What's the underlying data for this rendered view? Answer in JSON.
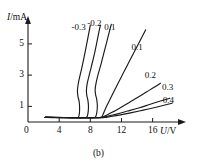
{
  "figure": {
    "caption": "(b)",
    "axes": {
      "y_axis_title": "I/mA",
      "y_axis_symbol": "I",
      "y_axis_unit": "/mA",
      "x_axis_title": "U/V",
      "x_axis_symbol": "U",
      "x_axis_unit": "/V",
      "origin_label": "0"
    }
  },
  "chart_data": {
    "type": "line",
    "title": "(b)",
    "xlabel": "U/V",
    "ylabel": "I/mA",
    "xlim": [
      0,
      19
    ],
    "ylim": [
      0,
      6.4
    ],
    "xticks": [
      0,
      4,
      8,
      12,
      16
    ],
    "xtick_labels": [
      "0",
      "4",
      "8",
      "12",
      "16"
    ],
    "yticks": [
      1,
      3,
      5
    ],
    "ytick_labels": [
      "1",
      "3",
      "5"
    ],
    "grid": false,
    "legend": "inline-curve-labels",
    "series": [
      {
        "name": "-0.3",
        "label": "-0.3",
        "label_position": {
          "x": 5.6,
          "y": 6.05
        },
        "points": [
          [
            2.2,
            0.3
          ],
          [
            3.5,
            0.28
          ],
          [
            5.0,
            0.27
          ],
          [
            6.0,
            0.27
          ],
          [
            6.45,
            0.3
          ],
          [
            6.6,
            0.55
          ],
          [
            6.62,
            1.0
          ],
          [
            6.55,
            1.35
          ],
          [
            6.42,
            1.62
          ],
          [
            6.35,
            1.95
          ],
          [
            6.42,
            2.35
          ],
          [
            6.62,
            2.85
          ],
          [
            6.9,
            3.45
          ],
          [
            7.2,
            4.15
          ],
          [
            7.5,
            4.9
          ],
          [
            7.78,
            5.62
          ],
          [
            8.0,
            6.2
          ]
        ]
      },
      {
        "name": "-0.2",
        "label": "-0.2",
        "label_position": {
          "x": 7.6,
          "y": 6.25
        },
        "points": [
          [
            2.2,
            0.3
          ],
          [
            4.2,
            0.28
          ],
          [
            6.2,
            0.27
          ],
          [
            7.2,
            0.27
          ],
          [
            7.55,
            0.32
          ],
          [
            7.72,
            0.62
          ],
          [
            7.76,
            1.05
          ],
          [
            7.68,
            1.42
          ],
          [
            7.55,
            1.7
          ],
          [
            7.5,
            2.02
          ],
          [
            7.6,
            2.45
          ],
          [
            7.85,
            2.98
          ],
          [
            8.15,
            3.58
          ],
          [
            8.5,
            4.3
          ],
          [
            8.82,
            5.05
          ],
          [
            9.1,
            5.75
          ],
          [
            9.3,
            6.2
          ]
        ]
      },
      {
        "name": "0.1",
        "label": "0.1",
        "label_position": {
          "x": 9.8,
          "y": 6.05
        },
        "points": [
          [
            2.2,
            0.3
          ],
          [
            5.0,
            0.28
          ],
          [
            7.2,
            0.27
          ],
          [
            8.3,
            0.27
          ],
          [
            8.68,
            0.33
          ],
          [
            8.85,
            0.66
          ],
          [
            8.9,
            1.08
          ],
          [
            8.82,
            1.45
          ],
          [
            8.68,
            1.75
          ],
          [
            8.62,
            2.08
          ],
          [
            8.75,
            2.52
          ],
          [
            9.0,
            3.05
          ],
          [
            9.35,
            3.65
          ],
          [
            9.72,
            4.38
          ],
          [
            10.1,
            5.1
          ],
          [
            10.45,
            5.8
          ],
          [
            10.7,
            6.25
          ]
        ]
      },
      {
        "name": "0.1",
        "label": "0.1",
        "label_position": {
          "x": 13.3,
          "y": 4.75
        },
        "points": [
          [
            2.2,
            0.3
          ],
          [
            6.0,
            0.28
          ],
          [
            8.6,
            0.27
          ],
          [
            9.4,
            0.3
          ],
          [
            9.6,
            0.45
          ],
          [
            9.9,
            0.8
          ],
          [
            10.3,
            1.22
          ],
          [
            10.85,
            1.78
          ],
          [
            11.5,
            2.42
          ],
          [
            12.2,
            3.1
          ],
          [
            12.9,
            3.78
          ],
          [
            13.6,
            4.45
          ],
          [
            14.2,
            5.02
          ],
          [
            14.8,
            5.6
          ],
          [
            15.1,
            5.9
          ]
        ]
      },
      {
        "name": "0.2",
        "label": "0.2",
        "label_position": {
          "x": 15.0,
          "y": 2.95
        },
        "points": [
          [
            2.2,
            0.3
          ],
          [
            6.5,
            0.28
          ],
          [
            8.8,
            0.27
          ],
          [
            9.5,
            0.3
          ],
          [
            10.0,
            0.42
          ],
          [
            10.8,
            0.62
          ],
          [
            11.8,
            0.9
          ],
          [
            12.9,
            1.22
          ],
          [
            14.0,
            1.55
          ],
          [
            15.2,
            1.92
          ],
          [
            16.2,
            2.22
          ],
          [
            17.0,
            2.48
          ]
        ]
      },
      {
        "name": "0.3",
        "label": "0.3",
        "label_position": {
          "x": 17.2,
          "y": 2.15
        },
        "points": [
          [
            2.2,
            0.3
          ],
          [
            7.0,
            0.28
          ],
          [
            9.0,
            0.27
          ],
          [
            9.6,
            0.3
          ],
          [
            10.3,
            0.38
          ],
          [
            11.5,
            0.52
          ],
          [
            12.8,
            0.7
          ],
          [
            14.2,
            0.9
          ],
          [
            15.6,
            1.12
          ],
          [
            17.0,
            1.34
          ],
          [
            18.2,
            1.52
          ]
        ]
      },
      {
        "name": "0.4",
        "label": "0.4",
        "label_position": {
          "x": 17.3,
          "y": 1.35
        },
        "points": [
          [
            2.2,
            0.3
          ],
          [
            7.2,
            0.28
          ],
          [
            9.1,
            0.27
          ],
          [
            9.8,
            0.29
          ],
          [
            10.6,
            0.35
          ],
          [
            11.9,
            0.46
          ],
          [
            13.3,
            0.6
          ],
          [
            14.8,
            0.76
          ],
          [
            16.3,
            0.93
          ],
          [
            17.7,
            1.1
          ],
          [
            18.5,
            1.2
          ]
        ]
      }
    ]
  },
  "style": {
    "curve_color": "#1a1a1a",
    "axis_color": "#1a1a1a",
    "background": "#ffffff"
  }
}
